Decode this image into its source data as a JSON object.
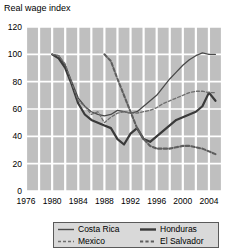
{
  "chart_data": {
    "type": "line",
    "title": "Real wage index",
    "xlabel": "",
    "ylabel": "",
    "xlim": [
      1976,
      2006
    ],
    "ylim": [
      0,
      120
    ],
    "grid": true,
    "legend_position": "bottom",
    "x_ticks": [
      "1976",
      "1980",
      "1984",
      "1988",
      "1992",
      "1996",
      "2000",
      "2004"
    ],
    "x_tick_values": [
      1976,
      1980,
      1984,
      1988,
      1992,
      1996,
      2000,
      2004
    ],
    "y_ticks": [
      "0",
      "20",
      "40",
      "60",
      "80",
      "100",
      "120"
    ],
    "y_tick_values": [
      0,
      20,
      40,
      60,
      80,
      100,
      120
    ],
    "series": [
      {
        "name": "Costa Rica",
        "style": "solid-thin",
        "color": "#4a4a4a",
        "x": [
          1980,
          1981,
          1982,
          1983,
          1984,
          1985,
          1986,
          1987,
          1988,
          1989,
          1990,
          1991,
          1992,
          1993,
          1994,
          1995,
          1996,
          1997,
          1998,
          1999,
          2000,
          2001,
          2002,
          2003,
          2004,
          2005
        ],
        "y": [
          100,
          99,
          92,
          80,
          68,
          62,
          58,
          56,
          55,
          56,
          59,
          58,
          57,
          58,
          62,
          66,
          70,
          76,
          82,
          87,
          92,
          96,
          99,
          101,
          100,
          100
        ]
      },
      {
        "name": "Honduras",
        "style": "solid-thick",
        "color": "#3a3a3a",
        "x": [
          1980,
          1981,
          1982,
          1983,
          1984,
          1985,
          1986,
          1987,
          1988,
          1989,
          1990,
          1991,
          1992,
          1993,
          1994,
          1995,
          1996,
          1997,
          1998,
          1999,
          2000,
          2001,
          2002,
          2003,
          2004,
          2005
        ],
        "y": [
          100,
          97,
          90,
          78,
          64,
          56,
          52,
          50,
          48,
          46,
          38,
          34,
          42,
          46,
          38,
          36,
          40,
          44,
          48,
          52,
          54,
          56,
          58,
          62,
          72,
          66
        ]
      },
      {
        "name": "Mexico",
        "style": "dashed-thin",
        "color": "#6e6e6e",
        "x": [
          1980,
          1981,
          1982,
          1983,
          1984,
          1985,
          1986,
          1987,
          1988,
          1989,
          1990,
          1991,
          1992,
          1993,
          1994,
          1995,
          1996,
          1997,
          1998,
          1999,
          2000,
          2001,
          2002,
          2003,
          2004,
          2005
        ],
        "y": [
          100,
          99,
          93,
          79,
          66,
          62,
          56,
          58,
          50,
          54,
          57,
          58,
          57,
          57,
          58,
          59,
          61,
          64,
          66,
          68,
          70,
          72,
          73,
          73,
          72,
          72
        ]
      },
      {
        "name": "El Salvador",
        "style": "dashed-thick",
        "color": "#5e5e5e",
        "x": [
          1988,
          1989,
          1990,
          1991,
          1992,
          1993,
          1994,
          1995,
          1996,
          1997,
          1998,
          1999,
          2000,
          2001,
          2002,
          2003,
          2004,
          2005
        ],
        "y": [
          100,
          95,
          82,
          70,
          58,
          46,
          38,
          33,
          31,
          31,
          31,
          32,
          33,
          33,
          32,
          31,
          29,
          27
        ]
      }
    ]
  },
  "legend": {
    "entries": [
      {
        "label": "Costa Rica",
        "style": "solid-thin"
      },
      {
        "label": "Honduras",
        "style": "solid-thick"
      },
      {
        "label": "Mexico",
        "style": "dashed-thin"
      },
      {
        "label": "El Salvador",
        "style": "dashed-thick"
      }
    ]
  },
  "colors": {
    "plot_background": "#bfbfbf",
    "gridline": "#ffffff",
    "text": "#000000",
    "legend_border": "#5a5a5a",
    "legend_background": "#d9d9d9"
  }
}
